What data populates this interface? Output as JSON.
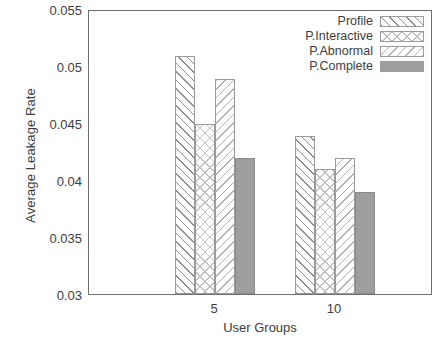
{
  "chart_data": {
    "type": "bar",
    "title": "",
    "xlabel": "User Groups",
    "ylabel": "Average Leakage Rate",
    "categories": [
      "5",
      "10"
    ],
    "series": [
      {
        "name": "Profile",
        "values": [
          0.051,
          0.044
        ],
        "pattern": "diagonal-forward-hatch",
        "color": "#8d8d8d"
      },
      {
        "name": "P.Interactive",
        "values": [
          0.045,
          0.041
        ],
        "pattern": "crosshatch",
        "color": "#c2c2c2"
      },
      {
        "name": "P.Abnormal",
        "values": [
          0.049,
          0.042
        ],
        "pattern": "diagonal-backward-hatch",
        "color": "#b0b0b0"
      },
      {
        "name": "P.Complete",
        "values": [
          0.042,
          0.039
        ],
        "pattern": "solid",
        "color": "#9e9e9e"
      }
    ],
    "ylim": [
      0.03,
      0.055
    ],
    "yticks": [
      "0.03",
      "0.035",
      "0.04",
      "0.045",
      "0.05",
      "0.055"
    ],
    "ytick_values": [
      0.03,
      0.035,
      0.04,
      0.045,
      0.05,
      0.055
    ],
    "grid": false,
    "legend_position": "top-right"
  },
  "axes": {
    "y_title": "Average Leakage Rate",
    "x_title": "User Groups",
    "y_labels": {
      "t0": "0.03",
      "t1": "0.035",
      "t2": "0.04",
      "t3": "0.045",
      "t4": "0.05",
      "t5": "0.055"
    },
    "x_labels": {
      "g0": "5",
      "g1": "10"
    }
  },
  "legend": {
    "items": [
      {
        "label": "Profile"
      },
      {
        "label": "P.Interactive"
      },
      {
        "label": "P.Abnormal"
      },
      {
        "label": "P.Complete"
      }
    ]
  }
}
